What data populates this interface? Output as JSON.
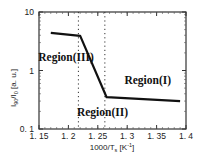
{
  "chart_data": {
    "type": "line",
    "title": "",
    "xlabel": "1000/T_s [K^-1]",
    "xlabel_main": "1000/T",
    "xlabel_sub": "s",
    "xlabel_unit": "[K",
    "xlabel_unit_sup": "-1",
    "xlabel_unit_close": "]",
    "ylabel": "I_90/I_0 [a. u.]",
    "ylabel_main1": "I",
    "ylabel_sub1": "90",
    "ylabel_slash": "/I",
    "ylabel_sub2": "0",
    "ylabel_unit": " [a. u.]",
    "xlim": [
      1.15,
      1.4
    ],
    "ylim": [
      0.1,
      10
    ],
    "yscale": "log",
    "grid": false,
    "x_ticks": [
      "1. 15",
      "1. 2",
      "1. 25",
      "1. 3",
      "1. 35",
      "1. 4"
    ],
    "x_tick_values": [
      1.15,
      1.2,
      1.25,
      1.3,
      1.35,
      1.4
    ],
    "y_ticks": [
      "0. 1",
      "1",
      "10"
    ],
    "y_tick_values": [
      0.1,
      1,
      10
    ],
    "series": [
      {
        "name": "I90/I0",
        "x": [
          1.17,
          1.22,
          1.265,
          1.39
        ],
        "y": [
          4.4,
          3.9,
          0.35,
          0.3
        ],
        "color": "#111111"
      }
    ],
    "vertical_dotted_lines": [
      1.217,
      1.262
    ],
    "annotations": [
      {
        "text": "Region(III)",
        "x": 1.196,
        "y": 1.45
      },
      {
        "text": "Region(II)",
        "x": 1.258,
        "y": 0.17
      },
      {
        "text": "Region(I)",
        "x": 1.335,
        "y": 0.58
      }
    ]
  }
}
